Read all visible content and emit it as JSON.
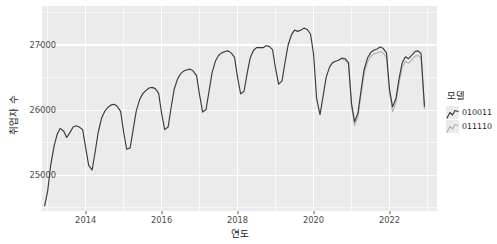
{
  "axes": {
    "x_title": "연도",
    "y_title": "취업자 수",
    "x_ticks": [
      "2014",
      "2016",
      "2018",
      "2020",
      "2022"
    ],
    "y_ticks": [
      "25000",
      "26000",
      "27000"
    ]
  },
  "legend": {
    "title": "모델",
    "items": [
      {
        "label": "010011",
        "color": "#3b3b3b"
      },
      {
        "label": "011110",
        "color": "#b4b4b4"
      }
    ]
  },
  "colors": {
    "panel_background": "#ebebeb",
    "grid_major": "#ffffff",
    "grid_minor": "#f7f7f7",
    "series_dark": "#3b3b3b",
    "series_light": "#b4b4b4",
    "axis_text": "#4d4d4d",
    "title_text": "#1a1a1a"
  },
  "chart_data": {
    "type": "line",
    "title": "",
    "xlabel": "연도",
    "ylabel": "취업자 수",
    "xlim": [
      2012.85,
      2023.25
    ],
    "ylim": [
      24450,
      27600
    ],
    "grid": true,
    "legend_position": "right",
    "legend_title": "모델",
    "x_tick_values": [
      2014,
      2016,
      2018,
      2020,
      2022
    ],
    "y_tick_values": [
      25000,
      26000,
      27000
    ],
    "series": [
      {
        "name": "010011",
        "color": "#3b3b3b",
        "x": [
          2012.92,
          2013.0,
          2013.08,
          2013.17,
          2013.25,
          2013.33,
          2013.42,
          2013.5,
          2013.58,
          2013.67,
          2013.75,
          2013.83,
          2013.92,
          2014.0,
          2014.08,
          2014.17,
          2014.25,
          2014.33,
          2014.42,
          2014.5,
          2014.58,
          2014.67,
          2014.75,
          2014.83,
          2014.92,
          2015.0,
          2015.08,
          2015.17,
          2015.25,
          2015.33,
          2015.42,
          2015.5,
          2015.58,
          2015.67,
          2015.75,
          2015.83,
          2015.92,
          2016.0,
          2016.08,
          2016.17,
          2016.25,
          2016.33,
          2016.42,
          2016.5,
          2016.58,
          2016.67,
          2016.75,
          2016.83,
          2016.92,
          2017.0,
          2017.08,
          2017.17,
          2017.25,
          2017.33,
          2017.42,
          2017.5,
          2017.58,
          2017.67,
          2017.75,
          2017.83,
          2017.92,
          2018.0,
          2018.08,
          2018.17,
          2018.25,
          2018.33,
          2018.42,
          2018.5,
          2018.58,
          2018.67,
          2018.75,
          2018.83,
          2018.92,
          2019.0,
          2019.08,
          2019.17,
          2019.25,
          2019.33,
          2019.42,
          2019.5,
          2019.58,
          2019.67,
          2019.75,
          2019.83,
          2019.92,
          2020.0,
          2020.08,
          2020.17,
          2020.25,
          2020.33,
          2020.42,
          2020.5,
          2020.58,
          2020.67,
          2020.75,
          2020.83,
          2020.92,
          2021.0,
          2021.08,
          2021.17,
          2021.25,
          2021.33,
          2021.42,
          2021.5,
          2021.58,
          2021.67,
          2021.75,
          2021.83,
          2021.92,
          2022.0,
          2022.08,
          2022.17,
          2022.25,
          2022.33,
          2022.42,
          2022.5,
          2022.58,
          2022.67,
          2022.75,
          2022.83,
          2022.92
        ],
        "y": [
          24530,
          24760,
          25160,
          25450,
          25630,
          25720,
          25680,
          25580,
          25650,
          25740,
          25760,
          25740,
          25700,
          25420,
          25150,
          25080,
          25360,
          25660,
          25880,
          25980,
          26040,
          26080,
          26090,
          26060,
          25980,
          25660,
          25400,
          25420,
          25700,
          25980,
          26160,
          26250,
          26300,
          26340,
          26350,
          26330,
          26260,
          25950,
          25700,
          25740,
          26040,
          26320,
          26480,
          26560,
          26600,
          26620,
          26630,
          26600,
          26530,
          26230,
          25970,
          26010,
          26300,
          26580,
          26760,
          26840,
          26880,
          26900,
          26910,
          26880,
          26810,
          26500,
          26250,
          26290,
          26560,
          26800,
          26920,
          26960,
          26960,
          26960,
          26990,
          26980,
          26930,
          26640,
          26400,
          26450,
          26740,
          27000,
          27160,
          27230,
          27210,
          27230,
          27260,
          27240,
          27170,
          26860,
          26180,
          25930,
          26210,
          26500,
          26660,
          26730,
          26750,
          26770,
          26800,
          26790,
          26730,
          26100,
          25820,
          25960,
          26300,
          26620,
          26800,
          26880,
          26920,
          26940,
          26970,
          26950,
          26880,
          26320,
          26050,
          26180,
          26480,
          26720,
          26820,
          26790,
          26840,
          26900,
          26910,
          26870,
          26060
        ]
      },
      {
        "name": "011110",
        "color": "#b4b4b4",
        "x": [
          2020.75,
          2020.83,
          2020.92,
          2021.0,
          2021.08,
          2021.17,
          2021.25,
          2021.33,
          2021.42,
          2021.5,
          2021.58,
          2021.67,
          2021.75,
          2021.83,
          2021.92,
          2022.0,
          2022.08,
          2022.17,
          2022.25,
          2022.33,
          2022.42,
          2022.5,
          2022.58,
          2022.67,
          2022.75,
          2022.83,
          2022.92
        ],
        "y": [
          26780,
          26770,
          26710,
          26060,
          25760,
          25900,
          26240,
          26560,
          26740,
          26820,
          26860,
          26880,
          26900,
          26880,
          26810,
          26250,
          25980,
          26110,
          26410,
          26650,
          26750,
          26720,
          26770,
          26830,
          26840,
          26800,
          26020
        ]
      }
    ]
  }
}
